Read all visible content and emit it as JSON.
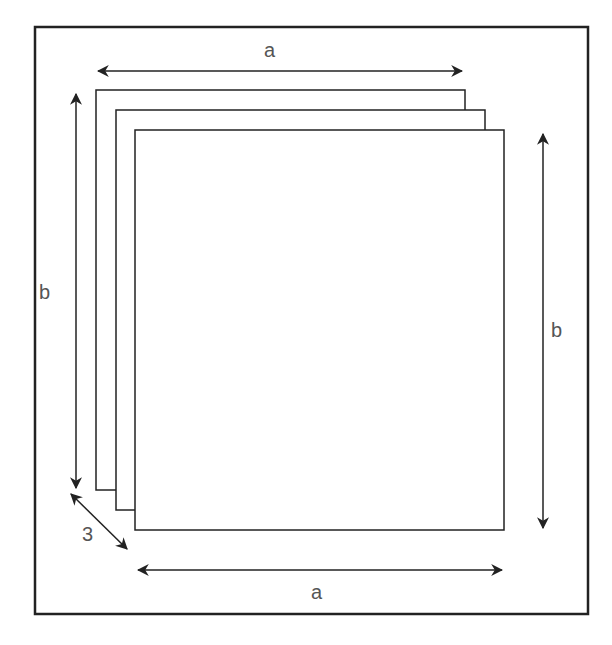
{
  "diagram": {
    "labels": {
      "top_width": "a",
      "bottom_width": "a",
      "left_height": "b",
      "right_height": "b",
      "depth": "3"
    },
    "sheet_count": 3,
    "colors": {
      "stroke": "#222222",
      "label": "#555555",
      "background": "#ffffff"
    }
  }
}
